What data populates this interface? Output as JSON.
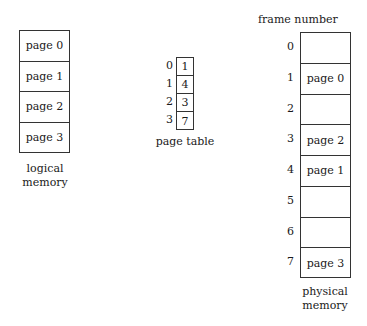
{
  "logical_memory": {
    "pages": [
      "page 0",
      "page 1",
      "page 2",
      "page 3"
    ],
    "label_line1": "logical",
    "label_line2": "memory"
  },
  "page_table": {
    "indices": [
      "0",
      "1",
      "2",
      "3"
    ],
    "frames": [
      "1",
      "4",
      "3",
      "7"
    ],
    "label": "page table"
  },
  "physical_memory": {
    "header": "frame number",
    "frame_numbers": [
      "0",
      "1",
      "2",
      "3",
      "4",
      "5",
      "6",
      "7"
    ],
    "frames": [
      "",
      "page 0",
      "",
      "page 2",
      "page 1",
      "",
      "",
      "page 3"
    ],
    "label_line1": "physical",
    "label_line2": "memory"
  }
}
